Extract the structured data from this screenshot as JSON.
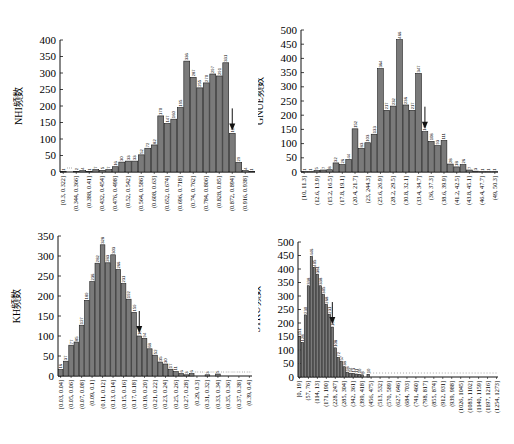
{
  "chart_data": [
    {
      "id": "nhi",
      "type": "bar",
      "title": "",
      "xlabel": "",
      "ylabel": "NHI频数",
      "ylim": [
        0,
        400
      ],
      "yticks": [
        0,
        50,
        100,
        150,
        200,
        250,
        300,
        350,
        400
      ],
      "grid": false,
      "categories": [
        "[0.3, 0.322]",
        "(0.322, 0.344]",
        "(0.344, 0.366]",
        "(0.366, 0.388]",
        "(0.388, 0.41]",
        "(0.41, 0.432]",
        "(0.432, 0.454]",
        "(0.454, 0.476]",
        "(0.476, 0.498]",
        "(0.498, 0.52]",
        "(0.52, 0.542]",
        "(0.542, 0.564]",
        "(0.564, 0.586]",
        "(0.586, 0.608]",
        "(0.608, 0.63]",
        "(0.63, 0.652]",
        "(0.652, 0.674]",
        "(0.674, 0.696]",
        "(0.696, 0.718]",
        "(0.718, 0.74]",
        "(0.74, 0.762]",
        "(0.762, 0.784]",
        "(0.784, 0.806]",
        "(0.806, 0.828]",
        "(0.828, 0.85]",
        "(0.85, 0.872]",
        "(0.872, 0.894]",
        "(0.894, 0.916]",
        "(0.916, 0.938]",
        "(0.938, 0.96]"
      ],
      "tick_labels": [
        "[0.3,  0.322]",
        "(0.344,  0.366]",
        "(0.388,  0.41]",
        "(0.432,  0.454]",
        "(0.476,  0.498]",
        "(0.52,  0.542]",
        "(0.564,  0.586]",
        "(0.608,  0.63]",
        "(0.652,  0.674]",
        "(0.696,  0.718]",
        "(0.74,  0.762]",
        "(0.784,  0.806]",
        "(0.828,  0.85]",
        "(0.872,  0.894]",
        "(0.916,  0.938]"
      ],
      "values": [
        1,
        0,
        2,
        4,
        1,
        7,
        5,
        7,
        16,
        30,
        33,
        33,
        52,
        72,
        82,
        170,
        147,
        160,
        195,
        336,
        287,
        255,
        270,
        297,
        291,
        331,
        117,
        29,
        4,
        1
      ],
      "arrow_bin": 26
    },
    {
      "id": "gnue",
      "type": "bar",
      "title": "",
      "xlabel": "",
      "ylabel": "GNUE频数",
      "ylim": [
        0,
        500
      ],
      "yticks": [
        0,
        50,
        100,
        150,
        200,
        250,
        300,
        350,
        400,
        450,
        500
      ],
      "grid": false,
      "categories": [
        "[10, 11.3]",
        "(11.3, 12.6]",
        "(12.6, 13.9]",
        "(13.9, 15.2]",
        "(15.2, 16.5]",
        "(16.5, 17.8]",
        "(17.8, 19.1]",
        "(19.1, 20.4]",
        "(20.4, 21.7]",
        "(21.7, 23]",
        "(23, 24.3]",
        "(24.3, 25.6]",
        "(25.6, 26.9]",
        "(26.9, 28.2]",
        "(28.2, 29.5]",
        "(29.5, 30.8]",
        "(30.8, 32.1]",
        "(32.1, 33.4]",
        "(33.4, 34.7]",
        "(34.7, 36]",
        "(36, 37.3]",
        "(37.3, 38.6]",
        "(38.6, 39.9]",
        "(39.9, 41.2]",
        "(41.2, 42.5]",
        "(42.5, 43.8]",
        "(43.8, 45.1]",
        "(45.1, 46.4]",
        "(46.4, 47.7]",
        "(47.7, 49]",
        "(49, 50.3]"
      ],
      "tick_labels": [
        "[10,  11.3]",
        "(12.6,  13.9]",
        "(15.2,  16.5]",
        "(17.8,  19.1]",
        "(20.4,  21.7]",
        "(23,  244.3]",
        "(25.6,  26.9]",
        "(28.2,  29.5]",
        "(30.8,  32.1]",
        "(33.4,  34.7]",
        "(36,  37.3]",
        "(38.6,  39.9]",
        "(41.2,  42.5]",
        "(43.8,  45.1]",
        "(46.4,  47.7]",
        "(49,  50.3]"
      ],
      "values": [
        1,
        1,
        5,
        7,
        8,
        32,
        26,
        44,
        152,
        83,
        103,
        133,
        364,
        217,
        232,
        466,
        236,
        217,
        347,
        142,
        108,
        93,
        111,
        28,
        18,
        26,
        7,
        3,
        1,
        1,
        1
      ],
      "arrow_bin": 19
    },
    {
      "id": "kh",
      "type": "bar",
      "title": "",
      "xlabel": "",
      "ylabel": "KH频数",
      "ylim": [
        0,
        350
      ],
      "yticks": [
        0,
        50,
        100,
        150,
        200,
        250,
        300,
        350
      ],
      "grid": false,
      "categories": [
        "[0.03, 0.04]",
        "(0.04, 0.05]",
        "(0.05, 0.06]",
        "(0.06, 0.07]",
        "(0.07, 0.08]",
        "(0.08, 0.09]",
        "(0.09, 0.1]",
        "(0.1, 0.11]",
        "(0.11, 0.12]",
        "(0.12, 0.13]",
        "(0.13, 0.14]",
        "(0.14, 0.15]",
        "(0.15, 0.16]",
        "(0.16, 0.17]",
        "(0.17, 0.18]",
        "(0.18, 0.19]",
        "(0.19, 0.20]",
        "(0.20, 0.21]",
        "(0.21, 0.22]",
        "(0.22, 0.23]",
        "(0.23, 0.24]",
        "(0.24, 0.25]",
        "(0.25, 0.26]",
        "(0.26, 0.27]",
        "(0.27, 0.28]",
        "(0.28, 0.29]",
        "(0.29, 0.3]",
        "(0.3, 0.31]",
        "(0.31, 0.32]",
        "(0.32, 0.33]",
        "(0.33, 0.34]",
        "(0.34, 0.35]",
        "(0.35, 0.36]",
        "(0.36, 0.37]",
        "(0.37, 0.38]",
        "(0.38, 0.39]",
        "(0.39, 0.4]"
      ],
      "tick_labels": [
        "[0.03,  0.04]",
        "(0.05,  0.06]",
        "(0.07,  0.08]",
        "(0.09,  0.1]",
        "(0.11,  0.12]",
        "(0.13,  0.14]",
        "(0.15,  0.16]",
        "(0.17,  0.18]",
        "(0.19,  0.20]",
        "(0.21,  0.22]",
        "(0.23,  0.24]",
        "(0.25,  0.26]",
        "(0.27,  0.28]",
        "(0.29,  0.3]",
        "(0.31,  0.32]",
        "(0.33,  0.34]",
        "(0.35,  0.36]",
        "(0.37,  0.38]",
        "(0.39,  0.4]"
      ],
      "values": [
        16,
        37,
        77,
        85,
        127,
        189,
        236,
        282,
        328,
        283,
        303,
        266,
        231,
        192,
        159,
        100,
        94,
        68,
        52,
        35,
        30,
        17,
        11,
        6,
        3,
        6,
        0,
        0,
        3,
        0,
        5,
        0,
        0,
        0,
        0,
        0,
        0
      ],
      "arrow_bin": 15
    },
    {
      "id": "stku",
      "type": "bar",
      "title": "",
      "xlabel": "",
      "ylabel": "STKU频数",
      "ylim": [
        0,
        500
      ],
      "yticks": [
        0,
        50,
        100,
        150,
        200,
        250,
        300,
        350,
        400,
        450,
        500
      ],
      "grid": false,
      "categories_note": "67 bins of width 19 from 0 to 1273",
      "tick_labels": [
        "[0,  19]",
        "(57,  76]",
        "(114,  13]",
        "(171,  190]",
        "(228,  247]",
        "(285,  304]",
        "(342,  361]",
        "(399,  418]",
        "(456,  475]",
        "(513,  532]",
        "(570,  589]",
        "(627,  646]",
        "(684,  703]",
        "(741,  460]",
        "(798,  817]",
        "(855,  874]",
        "(912,  931]",
        "(939,  988]",
        "(1026,  1045]",
        "(1083,  1102]",
        "(1140,  1159]",
        "(1197,  1216]",
        "(1254,  1273]"
      ],
      "values": [
        151,
        128,
        230,
        338,
        446,
        405,
        381,
        338,
        305,
        268,
        231,
        185,
        108,
        72,
        57,
        38,
        18,
        14,
        13,
        11,
        10,
        8,
        0,
        10,
        0,
        0,
        0,
        0,
        0,
        0,
        0,
        0,
        0,
        0,
        0,
        0,
        0,
        0,
        0,
        0,
        0,
        0,
        0,
        0,
        0,
        0,
        0,
        0,
        0,
        0,
        0,
        0,
        0,
        0,
        0,
        0,
        0,
        0,
        0,
        0,
        0,
        0,
        0,
        0,
        0,
        0,
        0
      ],
      "arrow_bin": 11
    }
  ],
  "colors": {
    "bar_fill": "#7a7a7a",
    "bar_stroke": "#1a1a1a",
    "axis": "#111111",
    "label_bg": "#ffffff"
  }
}
